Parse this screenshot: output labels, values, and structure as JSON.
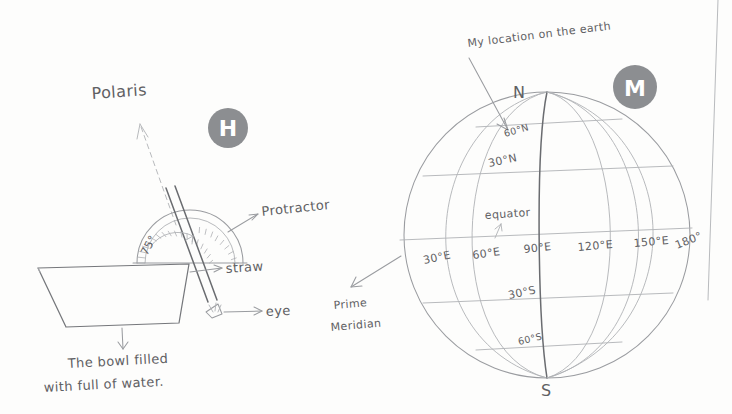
{
  "page": {
    "background_color": "#fdfdfc",
    "ink_color": "#5f6063",
    "badge_color": "#8c8e91",
    "badge_text_color": "#ffffff"
  },
  "figures": [
    {
      "id": "figure-h",
      "badge": "H",
      "title": "Measuring Polaris altitude with a protractor and straw over a bowl of water",
      "labels": {
        "polaris": "Polaris",
        "protractor": "Protractor",
        "straw": "straw",
        "eye": "eye",
        "angle": "75°",
        "caption_line1": "The bowl filled",
        "caption_line2": "with full of water."
      }
    },
    {
      "id": "figure-m",
      "badge": "M",
      "title": "Globe showing latitude and longitude grid",
      "labels": {
        "my_location": "My location on the earth",
        "north_pole": "N",
        "south_pole": "S",
        "equator": "equator",
        "prime_meridian_line1": "Prime",
        "prime_meridian_line2": "Meridian"
      },
      "latitudes": [
        {
          "label": "60°N",
          "value": 60,
          "hemisphere": "N"
        },
        {
          "label": "30°N",
          "value": 30,
          "hemisphere": "N"
        },
        {
          "label": "30°S",
          "value": -30,
          "hemisphere": "S"
        },
        {
          "label": "60°S",
          "value": -60,
          "hemisphere": "S"
        }
      ],
      "longitudes": [
        {
          "label": "30°E",
          "value": 30
        },
        {
          "label": "60°E",
          "value": 60
        },
        {
          "label": "90°E",
          "value": 90
        },
        {
          "label": "120°E",
          "value": 120
        },
        {
          "label": "150°E",
          "value": 150
        },
        {
          "label": "180°",
          "value": 180
        }
      ]
    }
  ]
}
